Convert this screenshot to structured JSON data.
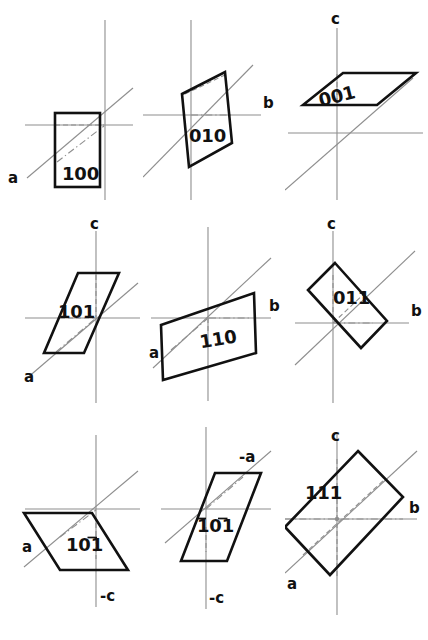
{
  "figure": {
    "background_color": "#ffffff",
    "axis_color": "#8e8e8e",
    "plane_outline_color": "#111111",
    "width": 428,
    "height": 640,
    "columns": 3,
    "rows": 3
  },
  "panels": [
    {
      "id": "panel-100",
      "index_label": "100",
      "index_digits": [
        {
          "digit": "1",
          "bar": false
        },
        {
          "digit": "0",
          "bar": false
        },
        {
          "digit": "0",
          "bar": false
        }
      ],
      "axis_labels": [
        {
          "name": "a",
          "text": "a"
        }
      ],
      "shape": "rectangle",
      "row": 1,
      "column": 1
    },
    {
      "id": "panel-010",
      "index_label": "010",
      "index_digits": [
        {
          "digit": "0",
          "bar": false
        },
        {
          "digit": "1",
          "bar": false
        },
        {
          "digit": "0",
          "bar": false
        }
      ],
      "axis_labels": [
        {
          "name": "b",
          "text": "b"
        }
      ],
      "shape": "parallelogram",
      "row": 1,
      "column": 2
    },
    {
      "id": "panel-001",
      "index_label": "001",
      "index_digits": [
        {
          "digit": "0",
          "bar": false
        },
        {
          "digit": "0",
          "bar": false
        },
        {
          "digit": "1",
          "bar": false
        }
      ],
      "axis_labels": [
        {
          "name": "c",
          "text": "c"
        }
      ],
      "shape": "flat-parallelogram",
      "row": 1,
      "column": 3
    },
    {
      "id": "panel-101",
      "index_label": "101",
      "index_digits": [
        {
          "digit": "1",
          "bar": false
        },
        {
          "digit": "0",
          "bar": false
        },
        {
          "digit": "1",
          "bar": false
        }
      ],
      "axis_labels": [
        {
          "name": "c",
          "text": "c"
        },
        {
          "name": "a",
          "text": "a"
        }
      ],
      "shape": "tall-parallelogram",
      "row": 2,
      "column": 1
    },
    {
      "id": "panel-110",
      "index_label": "110",
      "index_digits": [
        {
          "digit": "1",
          "bar": false
        },
        {
          "digit": "1",
          "bar": false
        },
        {
          "digit": "0",
          "bar": false
        }
      ],
      "axis_labels": [
        {
          "name": "b",
          "text": "b"
        },
        {
          "name": "a",
          "text": "a"
        }
      ],
      "shape": "wide-parallelogram",
      "row": 2,
      "column": 2
    },
    {
      "id": "panel-011",
      "index_label": "011",
      "index_digits": [
        {
          "digit": "0",
          "bar": false
        },
        {
          "digit": "1",
          "bar": false
        },
        {
          "digit": "1",
          "bar": false
        }
      ],
      "axis_labels": [
        {
          "name": "c",
          "text": "c"
        },
        {
          "name": "b",
          "text": "b"
        }
      ],
      "shape": "diamond",
      "row": 2,
      "column": 3
    },
    {
      "id": "panel-10-1",
      "index_label": "101̄",
      "index_digits": [
        {
          "digit": "1",
          "bar": false
        },
        {
          "digit": "0",
          "bar": false
        },
        {
          "digit": "1",
          "bar": true
        }
      ],
      "axis_labels": [
        {
          "name": "a",
          "text": "a"
        },
        {
          "name": "minus-c",
          "text": "-c"
        }
      ],
      "shape": "slanted-parallelogram",
      "row": 3,
      "column": 1
    },
    {
      "id": "panel--10-1",
      "index_label": "1̄0̄1̄",
      "index_digits": [
        {
          "digit": "1",
          "bar": true
        },
        {
          "digit": "0",
          "bar": false
        },
        {
          "digit": "1",
          "bar": true
        }
      ],
      "axis_labels": [
        {
          "name": "minus-a",
          "text": "-a"
        },
        {
          "name": "minus-c",
          "text": "-c"
        }
      ],
      "shape": "tall-parallelogram",
      "row": 3,
      "column": 2
    },
    {
      "id": "panel-111",
      "index_label": "111",
      "index_digits": [
        {
          "digit": "1",
          "bar": false
        },
        {
          "digit": "1",
          "bar": false
        },
        {
          "digit": "1",
          "bar": false
        }
      ],
      "axis_labels": [
        {
          "name": "c",
          "text": "c"
        },
        {
          "name": "b",
          "text": "b"
        },
        {
          "name": "a",
          "text": "a"
        }
      ],
      "shape": "large-quadrilateral",
      "row": 3,
      "column": 3
    }
  ]
}
